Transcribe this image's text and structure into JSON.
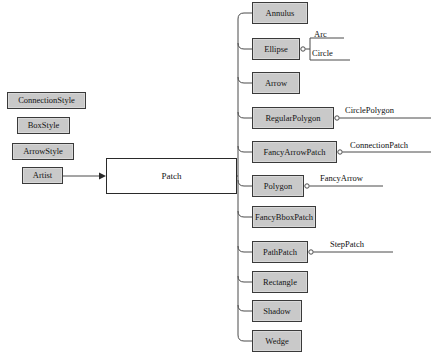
{
  "diagram": {
    "background": "#ffffff",
    "node_fill": "#c9c9c9",
    "node_stroke": "#3a3a3a",
    "root_fill": "#ffffff",
    "edge_color": "#4a4a4a"
  },
  "left_stack": [
    {
      "label": "ConnectionStyle",
      "x": 7,
      "y": 92,
      "w": 79,
      "h": 17
    },
    {
      "label": "BoxStyle",
      "x": 17,
      "y": 117,
      "w": 53,
      "h": 17
    },
    {
      "label": "ArrowStyle",
      "x": 12,
      "y": 143,
      "w": 62,
      "h": 17
    },
    {
      "label": "Artist",
      "x": 22,
      "y": 167,
      "w": 41,
      "h": 17
    }
  ],
  "root": {
    "label": "Patch",
    "x": 106,
    "y": 158,
    "w": 131,
    "h": 36
  },
  "children": [
    {
      "label": "Annulus",
      "x": 252,
      "y": 2,
      "w": 56,
      "h": 22
    },
    {
      "label": "Ellipse",
      "x": 252,
      "y": 38,
      "w": 48,
      "h": 22
    },
    {
      "label": "Arrow",
      "x": 252,
      "y": 72,
      "w": 48,
      "h": 22
    },
    {
      "label": "RegularPolygon",
      "x": 252,
      "y": 107,
      "w": 82,
      "h": 22
    },
    {
      "label": "FancyArrowPatch",
      "x": 252,
      "y": 141,
      "w": 85,
      "h": 22
    },
    {
      "label": "Polygon",
      "x": 252,
      "y": 175,
      "w": 52,
      "h": 22
    },
    {
      "label": "FancyBboxPatch",
      "x": 252,
      "y": 206,
      "w": 64,
      "h": 22
    },
    {
      "label": "PathPatch",
      "x": 252,
      "y": 241,
      "w": 56,
      "h": 22
    },
    {
      "label": "Rectangle",
      "x": 252,
      "y": 271,
      "w": 56,
      "h": 22
    },
    {
      "label": "Shadow",
      "x": 252,
      "y": 300,
      "w": 50,
      "h": 22
    },
    {
      "label": "Wedge",
      "x": 252,
      "y": 330,
      "w": 50,
      "h": 22
    }
  ],
  "leaf_labels": [
    {
      "label": "Arc",
      "x": 314,
      "y": 30
    },
    {
      "label": "Circle",
      "x": 312,
      "y": 49
    },
    {
      "label": "CirclePolygon",
      "x": 345,
      "y": 106
    },
    {
      "label": "ConnectionPatch",
      "x": 350,
      "y": 141
    },
    {
      "label": "FancyArrow",
      "x": 320,
      "y": 174
    },
    {
      "label": "StepPatch",
      "x": 330,
      "y": 240
    }
  ]
}
